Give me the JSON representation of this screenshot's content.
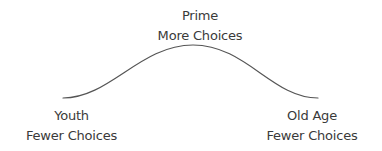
{
  "diagram": {
    "type": "bell-curve",
    "curve_color": "#555555",
    "labels": {
      "peak": {
        "title": "Prime",
        "subtitle": "More Choices"
      },
      "left": {
        "title": "Youth",
        "subtitle": "Fewer Choices"
      },
      "right": {
        "title": "Old Age",
        "subtitle": "Fewer Choices"
      }
    }
  }
}
